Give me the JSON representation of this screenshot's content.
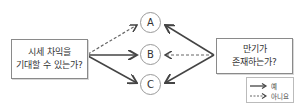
{
  "left_box": {
    "line1": "시세 차익을",
    "line2": "기대할 수 있는가?"
  },
  "right_box": {
    "line1": "만기가",
    "line2": "존재하는가?"
  },
  "nodes": [
    {
      "label": "A"
    },
    {
      "label": "B"
    },
    {
      "label": "C"
    }
  ],
  "legend": {
    "yes": "예",
    "no": "아니요"
  },
  "colors": {
    "arrow": "#444444",
    "border": "#8a8a8a"
  }
}
